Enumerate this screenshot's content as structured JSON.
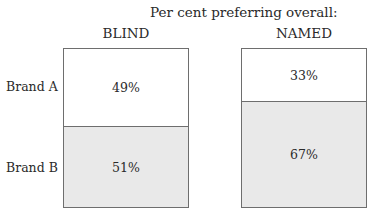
{
  "chart_data": {
    "type": "bar",
    "subtype": "stacked-100-percent",
    "title": "Per cent preferring overall:",
    "categories": [
      "BLIND",
      "NAMED"
    ],
    "series": [
      {
        "name": "Brand A",
        "values": [
          49,
          33
        ]
      },
      {
        "name": "Brand B",
        "values": [
          51,
          67
        ]
      }
    ],
    "value_labels": {
      "BLIND": {
        "Brand A": "49%",
        "Brand B": "51%"
      },
      "NAMED": {
        "Brand A": "33%",
        "Brand B": "67%"
      }
    },
    "xlabel": "",
    "ylabel": "",
    "ylim": [
      0,
      100
    ],
    "grid": false,
    "legend": "row labels on left",
    "colors": {
      "Brand A": "#ffffff",
      "Brand B": "#e9e9e9",
      "border": "#6e6e6e"
    }
  },
  "labels": {
    "title": "Per cent preferring overall:",
    "blind": "BLIND",
    "named": "NAMED",
    "brand_a": "Brand A",
    "brand_b": "Brand B",
    "blind_a": "49%",
    "blind_b": "51%",
    "named_a": "33%",
    "named_b": "67%"
  }
}
